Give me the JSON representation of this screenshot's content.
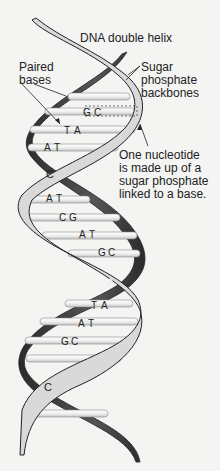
{
  "title": "DNA double helix",
  "labels": {
    "paired_bases": "Paired\nbases",
    "backbones": "Sugar\nphosphate\nbackbones",
    "nucleotide": "One nucleotide\nis made up of a\nsugar phosphate\nlinked to a base."
  },
  "base_pairs": [
    {
      "left": "G",
      "right": "C"
    },
    {
      "left": "T",
      "right": "A"
    },
    {
      "left": "A",
      "right": "T"
    },
    {
      "left": "A",
      "right": "T"
    },
    {
      "left": "C",
      "right": "G"
    },
    {
      "left": "A",
      "right": "T"
    },
    {
      "left": "G",
      "right": "C"
    },
    {
      "left": "T",
      "right": "A"
    },
    {
      "left": "A",
      "right": "T"
    },
    {
      "left": "G",
      "right": "C"
    }
  ],
  "strand_letters": [
    "C",
    "A",
    "C"
  ],
  "colors": {
    "light_strand": "#d9d9d9",
    "dark_strand": "#3a3a3a",
    "rung": "#ececec",
    "outline": "#222222",
    "background": "#f4f4f3"
  }
}
